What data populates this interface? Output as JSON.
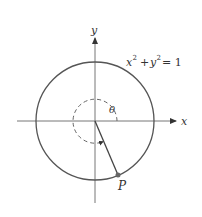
{
  "diagram": {
    "equation": {
      "x": "x",
      "plus": "+",
      "y": "y",
      "exp": "2",
      "equals": "= 1"
    },
    "axes": {
      "x_label": "x",
      "y_label": "y"
    },
    "angle_label": "θ",
    "point_label": "P",
    "colors": {
      "stroke": "#555555",
      "point": "#666666",
      "background": "#ffffff"
    }
  }
}
